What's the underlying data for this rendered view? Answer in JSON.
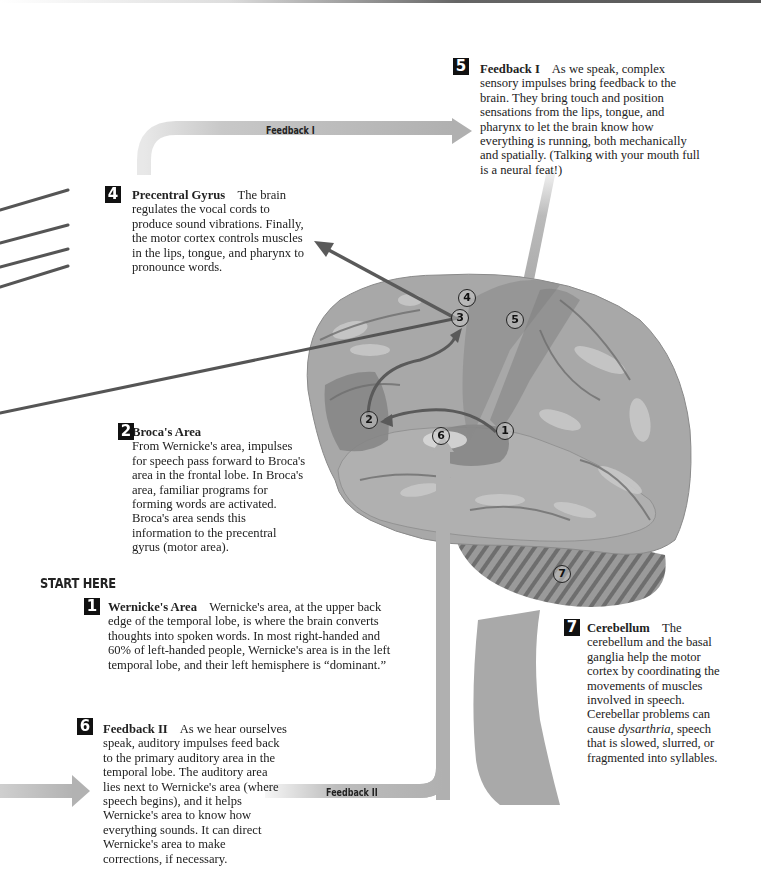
{
  "diagram": {
    "colors": {
      "brain_base": "#a6a6a6",
      "brain_dark": "#7d7d7d",
      "brain_light": "#c4c4c4",
      "arrow_dark": "#555555",
      "arrow_light": "#b0b0b0",
      "badge": "#111111"
    },
    "start_here": "START HERE",
    "arrows": {
      "feedback_1_label": "Feedback I",
      "feedback_2_label": "Feedback II"
    },
    "markers": [
      "1",
      "2",
      "3",
      "4",
      "5",
      "6",
      "7"
    ],
    "steps": [
      {
        "number": "1",
        "title": "Wernicke's Area",
        "text": "Wernicke's area, at the upper back edge of the temporal lobe, is where the brain converts thoughts into spoken words. In most right-handed and 60% of left-handed people, Wernicke's area is in the left temporal lobe, and their left hemisphere is “dominant.”"
      },
      {
        "number": "2",
        "title": "Broca's Area",
        "text": "From Wernicke's area, impulses for speech pass forward to Broca's area in the frontal lobe. In Broca's area, familiar programs for forming words are activated. Broca's area sends this information to the precentral gyrus (motor area)."
      },
      {
        "number": "4",
        "title": "Precentral Gyrus",
        "text": "The brain regulates the vocal cords to produce sound vibrations. Finally, the motor cortex controls muscles in the lips, tongue, and pharynx to pronounce words."
      },
      {
        "number": "5",
        "title": "Feedback I",
        "text": "As we speak, complex sensory impulses bring feedback to the brain. They bring touch and position sensations from the lips, tongue, and pharynx to let the brain know how everything is running, both mechanically and spatially. (Talking with your mouth full is a neural feat!)"
      },
      {
        "number": "6",
        "title": "Feedback II",
        "text": "As we hear ourselves speak, auditory impulses feed back to the primary auditory area in the temporal lobe. The auditory area lies next to Wernicke's area (where speech begins), and it helps Wernicke's area to know how everything sounds. It can direct Wernicke's area to make corrections, if necessary."
      },
      {
        "number": "7",
        "title": "Cerebellum",
        "text_before": "The cerebellum and the basal ganglia help the motor cortex by coordinating the movements of muscles involved in speech. Cerebellar problems can cause ",
        "text_italic": "dysarthria",
        "text_after": ", speech that is slowed, slurred, or fragmented into syllables."
      }
    ]
  }
}
